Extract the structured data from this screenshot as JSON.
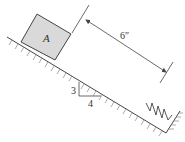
{
  "diagram": {
    "block": {
      "label": "A",
      "fill": "#d9d9d9",
      "stroke": "#444444"
    },
    "dimension": {
      "label": "6″"
    },
    "slope": {
      "rise": "3",
      "run": "4"
    },
    "colors": {
      "line": "#444444",
      "hatch": "#777777"
    }
  }
}
